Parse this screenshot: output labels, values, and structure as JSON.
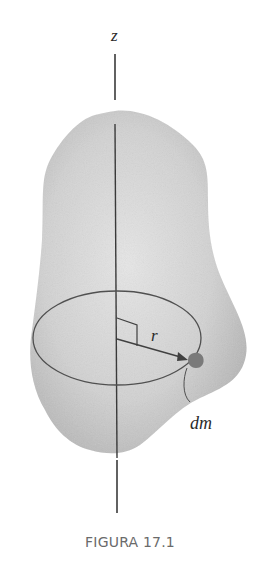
{
  "figure": {
    "caption": "FIGURA 17.1",
    "labels": {
      "axis": "z",
      "radius": "r",
      "mass_element": "dm"
    },
    "colors": {
      "body_fill_light": "#e4e4e4",
      "body_fill_dark": "#b4b4b4",
      "axis_line": "#3a3a3a",
      "ellipse": "#505050",
      "mass_element": "#7a7a7a",
      "caption_text": "#6a6a6a"
    }
  }
}
